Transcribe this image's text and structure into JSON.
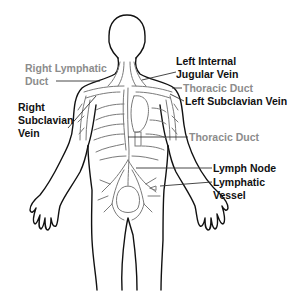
{
  "figure": {
    "colors": {
      "outline": "#111111",
      "lymph": "#7a7a7a",
      "label_dark": "#111111",
      "label_gray": "#8c8c8c",
      "leader": "#333333"
    }
  },
  "labels": {
    "right_lymphatic_duct": {
      "line1": "Right Lymphatic",
      "line2": "Duct",
      "tone": "gray"
    },
    "right_subclavian_vein": {
      "line1": "Right",
      "line2": "Subclavian",
      "line3": "Vein",
      "tone": "dark"
    },
    "left_internal_jugular_vein": {
      "line1": "Left Internal",
      "line2": "Jugular Vein",
      "tone": "dark"
    },
    "thoracic_duct_upper": {
      "text": "Thoracic Duct",
      "tone": "gray"
    },
    "left_subclavian_vein": {
      "text": "Left Subclavian Vein",
      "tone": "dark"
    },
    "thoracic_duct_lower": {
      "text": "Thoracic Duct",
      "tone": "gray"
    },
    "lymph_node": {
      "text": "Lymph Node",
      "tone": "dark"
    },
    "lymphatic_vessel": {
      "line1": "Lymphatic",
      "line2": "Vessel",
      "tone": "dark"
    }
  }
}
